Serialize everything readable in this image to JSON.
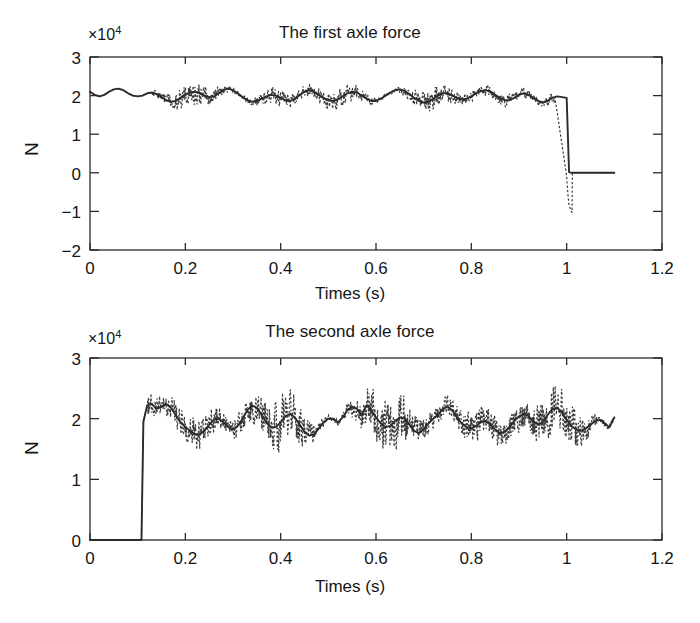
{
  "figure": {
    "width": 700,
    "height": 623,
    "background": "#ffffff",
    "ink_color": "#2b2b2b"
  },
  "chart_data": [
    {
      "type": "line",
      "panel": "top",
      "title": "The first axle force",
      "xlabel": "Times (s)",
      "ylabel": "N",
      "y_exponent_label": "×10",
      "y_exponent_value": "4",
      "y_scale": 10000,
      "xlim": [
        0,
        1.2
      ],
      "ylim": [
        -2,
        3
      ],
      "xticks": [
        0,
        0.2,
        0.4,
        0.6,
        0.8,
        1,
        1.2
      ],
      "xticklabels": [
        "0",
        "0.2",
        "0.4",
        "0.6",
        "0.8",
        "1",
        "1.2"
      ],
      "yticks": [
        -2,
        -1,
        0,
        1,
        2,
        3
      ],
      "yticklabels": [
        "−2",
        "−1",
        "0",
        "1",
        "2",
        "3"
      ],
      "grid": false,
      "legend": false,
      "series": [
        {
          "name": "mean axle force (solid)",
          "style": "solid",
          "description": "Oscillating force around 2e4 N from t=0 to t=1.0, then steps down to 0 and stays flat until t=1.1",
          "x": [
            0.0,
            0.01,
            0.02,
            0.03,
            0.04,
            0.05,
            0.06,
            0.07,
            0.08,
            0.09,
            0.1,
            0.11,
            0.12,
            0.13,
            0.14,
            0.15,
            0.16,
            0.17,
            0.18,
            0.19,
            0.2,
            0.21,
            0.22,
            0.23,
            0.24,
            0.25,
            0.26,
            0.27,
            0.28,
            0.29,
            0.3,
            0.31,
            0.32,
            0.33,
            0.34,
            0.35,
            0.36,
            0.37,
            0.38,
            0.39,
            0.4,
            0.41,
            0.42,
            0.43,
            0.44,
            0.45,
            0.46,
            0.47,
            0.48,
            0.49,
            0.5,
            0.51,
            0.52,
            0.53,
            0.54,
            0.55,
            0.56,
            0.57,
            0.58,
            0.59,
            0.6,
            0.61,
            0.62,
            0.63,
            0.64,
            0.65,
            0.66,
            0.67,
            0.68,
            0.69,
            0.7,
            0.71,
            0.72,
            0.73,
            0.74,
            0.75,
            0.76,
            0.77,
            0.78,
            0.79,
            0.8,
            0.81,
            0.82,
            0.83,
            0.84,
            0.85,
            0.86,
            0.87,
            0.88,
            0.89,
            0.9,
            0.91,
            0.92,
            0.93,
            0.94,
            0.95,
            0.96,
            0.97,
            0.98,
            0.99,
            1.0,
            1.005,
            1.01,
            1.05,
            1.1
          ],
          "y": [
            2.1,
            2.02,
            1.98,
            2.02,
            2.1,
            2.16,
            2.18,
            2.14,
            2.06,
            2.0,
            1.98,
            2.0,
            2.06,
            2.08,
            2.04,
            1.96,
            1.88,
            1.84,
            1.86,
            1.94,
            2.02,
            2.08,
            2.1,
            2.06,
            2.0,
            1.96,
            1.98,
            2.06,
            2.14,
            2.18,
            2.14,
            2.06,
            1.96,
            1.88,
            1.84,
            1.86,
            1.92,
            1.98,
            2.02,
            2.0,
            1.94,
            1.88,
            1.86,
            1.92,
            2.02,
            2.1,
            2.14,
            2.1,
            2.02,
            1.94,
            1.88,
            1.86,
            1.9,
            1.98,
            2.06,
            2.1,
            2.08,
            2.0,
            1.92,
            1.86,
            1.86,
            1.92,
            2.0,
            2.08,
            2.14,
            2.16,
            2.12,
            2.04,
            1.94,
            1.86,
            1.82,
            1.84,
            1.92,
            2.0,
            2.06,
            2.06,
            2.0,
            1.94,
            1.9,
            1.92,
            1.98,
            2.06,
            2.12,
            2.14,
            2.1,
            2.02,
            1.94,
            1.88,
            1.88,
            1.94,
            2.02,
            2.06,
            2.02,
            1.94,
            1.86,
            1.82,
            1.86,
            1.94,
            1.98,
            1.96,
            1.94,
            0.02,
            0.0,
            0.0,
            0.0
          ]
        },
        {
          "name": "instantaneous axle force (dotted)",
          "style": "dotted",
          "description": "High-frequency noisy signal scattered about the solid mean, spread roughly ±0.35e4 N; during the t≈1.0 drop it plunges to about −1.0e4 N",
          "noise_amplitude": 0.33,
          "noise_start_time": 0.13,
          "drop_min_value": -1.05
        }
      ]
    },
    {
      "type": "line",
      "panel": "bottom",
      "title": "The second axle force",
      "xlabel": "Times (s)",
      "ylabel": "N",
      "y_exponent_label": "×10",
      "y_exponent_value": "4",
      "y_scale": 10000,
      "xlim": [
        0,
        1.2
      ],
      "ylim": [
        0,
        3
      ],
      "xticks": [
        0,
        0.2,
        0.4,
        0.6,
        0.8,
        1,
        1.2
      ],
      "xticklabels": [
        "0",
        "0.2",
        "0.4",
        "0.6",
        "0.8",
        "1",
        "1.2"
      ],
      "yticks": [
        0,
        1,
        2,
        3
      ],
      "yticklabels": [
        "0",
        "1",
        "2",
        "3"
      ],
      "grid": false,
      "legend": false,
      "series": [
        {
          "name": "mean axle force (solid)",
          "style": "solid",
          "description": "Zero until t≈0.11, then jumps up to about 2.2e4 N and oscillates around 1.95e4 N through t=1.1",
          "x": [
            0.0,
            0.1,
            0.108,
            0.112,
            0.12,
            0.13,
            0.14,
            0.15,
            0.16,
            0.17,
            0.18,
            0.19,
            0.2,
            0.21,
            0.22,
            0.23,
            0.24,
            0.25,
            0.26,
            0.27,
            0.28,
            0.29,
            0.3,
            0.31,
            0.32,
            0.33,
            0.34,
            0.35,
            0.36,
            0.37,
            0.38,
            0.39,
            0.4,
            0.41,
            0.42,
            0.43,
            0.44,
            0.45,
            0.46,
            0.47,
            0.48,
            0.49,
            0.5,
            0.51,
            0.52,
            0.53,
            0.54,
            0.55,
            0.56,
            0.57,
            0.58,
            0.59,
            0.6,
            0.61,
            0.62,
            0.63,
            0.64,
            0.65,
            0.66,
            0.67,
            0.68,
            0.69,
            0.7,
            0.71,
            0.72,
            0.73,
            0.74,
            0.75,
            0.76,
            0.77,
            0.78,
            0.79,
            0.8,
            0.81,
            0.82,
            0.83,
            0.84,
            0.85,
            0.86,
            0.87,
            0.88,
            0.89,
            0.9,
            0.91,
            0.92,
            0.93,
            0.94,
            0.95,
            0.96,
            0.97,
            0.98,
            0.99,
            1.0,
            1.01,
            1.02,
            1.03,
            1.04,
            1.05,
            1.06,
            1.07,
            1.08,
            1.09,
            1.1
          ],
          "y": [
            0.0,
            0.0,
            0.0,
            1.95,
            2.22,
            2.24,
            2.16,
            2.2,
            2.24,
            2.18,
            2.06,
            1.94,
            1.86,
            1.8,
            1.74,
            1.74,
            1.8,
            1.9,
            1.98,
            2.0,
            1.94,
            1.86,
            1.82,
            1.88,
            2.0,
            2.14,
            2.22,
            2.18,
            2.06,
            1.94,
            1.86,
            1.86,
            1.94,
            2.04,
            2.08,
            2.02,
            1.9,
            1.78,
            1.72,
            1.74,
            1.84,
            1.94,
            2.0,
            2.0,
            1.94,
            2.02,
            2.14,
            2.2,
            2.16,
            2.06,
            2.22,
            2.14,
            2.02,
            1.92,
            1.86,
            1.88,
            1.96,
            2.02,
            2.0,
            1.9,
            1.8,
            1.76,
            1.82,
            1.92,
            2.0,
            2.06,
            2.16,
            2.2,
            2.14,
            2.02,
            1.92,
            1.86,
            1.84,
            1.88,
            1.94,
            1.96,
            1.9,
            1.82,
            1.76,
            1.78,
            1.86,
            1.96,
            2.04,
            2.08,
            2.04,
            1.96,
            1.9,
            1.94,
            2.06,
            2.16,
            2.18,
            2.1,
            1.98,
            1.88,
            1.82,
            1.8,
            1.84,
            1.9,
            1.96,
            1.98,
            1.92,
            1.86,
            2.02
          ]
        },
        {
          "name": "instantaneous axle force (dotted)",
          "style": "dotted",
          "description": "High-frequency noisy signal scattered about the solid mean with larger spread than the first axle, roughly ±0.45e4 N, dipping as low as 1.1e4 N and peaking near 2.7e4 N",
          "noise_amplitude": 0.45,
          "noise_start_time": 0.12,
          "rise_min_value": 0.0
        }
      ]
    }
  ]
}
